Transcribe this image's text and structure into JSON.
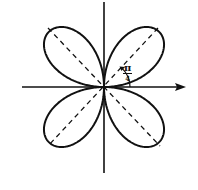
{
  "diagram": {
    "curve": {
      "type": "rose",
      "petals": 4,
      "orientation_deg": [
        45,
        135,
        225,
        315
      ]
    },
    "axes": {
      "horizontal_arrow": true,
      "vertical_arrow": false
    },
    "angle_label": {
      "numerator": "π",
      "denominator": "4"
    },
    "colors": {
      "stroke": "#111111",
      "background": "#ffffff"
    }
  }
}
